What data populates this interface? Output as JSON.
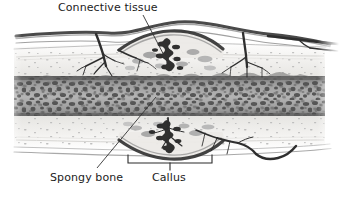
{
  "figure": {
    "width": 339,
    "height": 197,
    "background_color": "#ffffff"
  },
  "labels": {
    "connective_tissue": "Connective tissue",
    "spongy_bone": "Spongy bone",
    "callus": "Callus"
  },
  "colors": {
    "background": "#ffffff",
    "text": "#1c1c1c",
    "leader_line": "#333333",
    "bracket": "#2b2b2b",
    "periosteum": "#3a3a3a",
    "vessel_dark": "#2e2e2e",
    "vessel_mid": "#6a6a6a",
    "compact_bone": "#f1f0ee",
    "compact_bone_fleck": "#b9b9b9",
    "spongy_bone_dark": "#4f4f4f",
    "spongy_bone_mid": "#8a8a8a",
    "spongy_bone_light": "#cacaca",
    "callus_dark": "#2a2a2a",
    "callus_mid": "#777777",
    "marrow_cavity": "#9a9a9a"
  },
  "annotations": {
    "connective_tissue_leader": {
      "from_x": 143,
      "from_y": 15,
      "to_x": 168,
      "to_y": 63
    },
    "spongy_bone_leader": {
      "from_x": 97,
      "from_y": 168,
      "to_x": 156,
      "to_y": 97
    },
    "callus_bracket": {
      "left_x": 128,
      "right_x": 212,
      "top_y": 155,
      "bottom_y": 163,
      "center_x": 170,
      "tick_y": 170
    }
  },
  "anatomy": {
    "layers": [
      "periosteum",
      "compact bone",
      "spongy bone",
      "compact bone",
      "periosteum"
    ],
    "features": [
      "blood vessels branching into bone",
      "callus bulge at fracture site",
      "trabecular spongy bone texture"
    ]
  }
}
